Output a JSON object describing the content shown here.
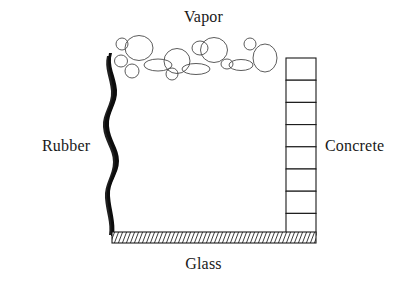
{
  "diagram": {
    "background_color": "#ffffff",
    "stroke_color": "#1a1a1a",
    "bubble_stroke_color": "#4a4a4a",
    "labels": {
      "vapor": "Vapor",
      "rubber": "Rubber",
      "concrete": "Concrete",
      "glass": "Glass"
    },
    "components": {
      "vapor": {
        "name": "Vapor",
        "description": "cluster of bubbles",
        "bubble_count": 20,
        "bubbles": [
          {
            "cx": 122,
            "cy": 44,
            "rx": 6,
            "ry": 6
          },
          {
            "cx": 139,
            "cy": 48,
            "rx": 14,
            "ry": 12
          },
          {
            "cx": 121,
            "cy": 61,
            "rx": 6,
            "ry": 6
          },
          {
            "cx": 132,
            "cy": 71,
            "rx": 7,
            "ry": 7
          },
          {
            "cx": 158,
            "cy": 65,
            "rx": 14,
            "ry": 6
          },
          {
            "cx": 177,
            "cy": 61,
            "rx": 13,
            "ry": 12
          },
          {
            "cx": 172,
            "cy": 74,
            "rx": 6,
            "ry": 6
          },
          {
            "cx": 196,
            "cy": 68,
            "rx": 14,
            "ry": 6
          },
          {
            "cx": 200,
            "cy": 48,
            "rx": 8,
            "ry": 7
          },
          {
            "cx": 213,
            "cy": 49,
            "rx": 13,
            "ry": 12
          },
          {
            "cx": 226,
            "cy": 63,
            "rx": 6,
            "ry": 5
          },
          {
            "cx": 240,
            "cy": 64,
            "rx": 12,
            "ry": 6
          },
          {
            "cx": 250,
            "cy": 44,
            "rx": 6,
            "ry": 6
          },
          {
            "cx": 264,
            "cy": 58,
            "rx": 12,
            "ry": 14
          }
        ]
      },
      "rubber": {
        "name": "Rubber",
        "description": "wavy vertical flexible membrane",
        "position": "left",
        "x_min": 106,
        "x_max": 122,
        "y_top": 53,
        "y_bottom": 236
      },
      "concrete": {
        "name": "Concrete",
        "description": "stacked masonry block column",
        "position": "right",
        "block_count": 8,
        "x_left": 286,
        "x_right": 316,
        "y_top": 58,
        "y_bottom": 235
      },
      "glass": {
        "name": "Glass",
        "description": "hatched horizontal base slab",
        "position": "bottom",
        "x_left": 112,
        "x_right": 316,
        "y_top": 232,
        "y_bottom": 243,
        "hatch_line_count": 46
      }
    }
  }
}
